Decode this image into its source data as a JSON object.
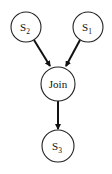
{
  "diagram": {
    "type": "directed-graph",
    "nodes": [
      {
        "id": "s2",
        "label": "S",
        "subscript": "2",
        "cx": 26,
        "cy": 27,
        "r": 15
      },
      {
        "id": "s1",
        "label": "S",
        "subscript": "1",
        "cx": 88,
        "cy": 27,
        "r": 15
      },
      {
        "id": "join",
        "label": "Join",
        "subscript": "",
        "cx": 58,
        "cy": 84,
        "r": 17
      },
      {
        "id": "s3",
        "label": "S",
        "subscript": "3",
        "cx": 58,
        "cy": 146,
        "r": 16
      }
    ],
    "edges": [
      {
        "from": "s2",
        "to": "join"
      },
      {
        "from": "s1",
        "to": "join"
      },
      {
        "from": "join",
        "to": "s3"
      }
    ],
    "colors": {
      "stroke": "#222222",
      "arrow": "#111111",
      "background": "#ffffff"
    }
  }
}
